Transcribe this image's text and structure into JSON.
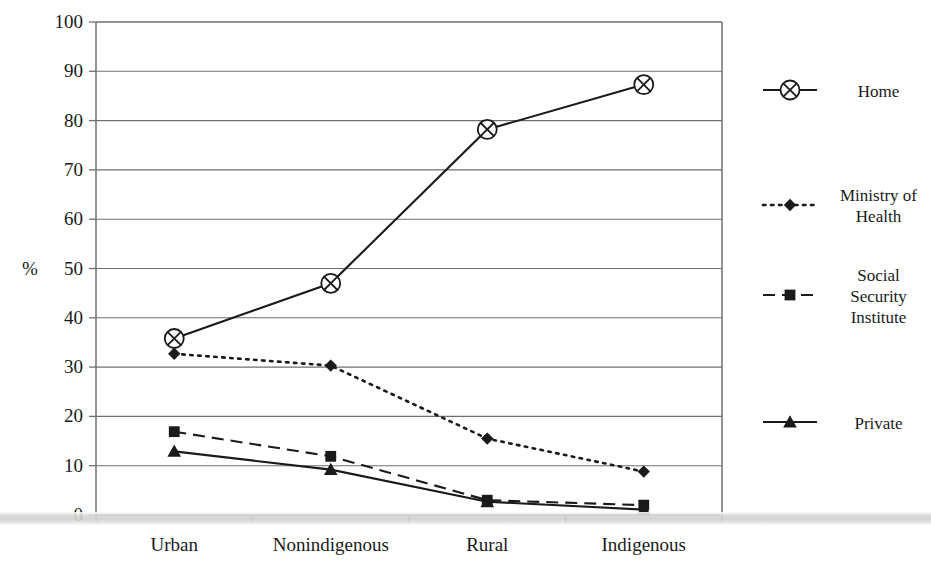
{
  "chart_data": {
    "type": "line",
    "title": "",
    "subtitle": "",
    "xlabel": "",
    "ylabel": "%",
    "categories": [
      "Urban",
      "Nonindigenous",
      "Rural",
      "Indigenous"
    ],
    "ylim": [
      0,
      100
    ],
    "ytick_labels": [
      "0",
      "10",
      "20",
      "30",
      "40",
      "50",
      "60",
      "70",
      "80",
      "90",
      "100"
    ],
    "ytick_values": [
      0,
      10,
      20,
      30,
      40,
      50,
      60,
      70,
      80,
      90,
      100
    ],
    "grid": true,
    "legend_position": "right",
    "series": [
      {
        "name": "Home",
        "marker": "circle-cross",
        "line_style": "solid",
        "color": "#1a1a1a",
        "values": [
          35.8,
          47.0,
          78.2,
          87.3
        ]
      },
      {
        "name": "Ministry of\nHealth",
        "marker": "diamond",
        "line_style": "dotted",
        "color": "#1a1a1a",
        "values": [
          32.7,
          30.3,
          15.5,
          8.8
        ]
      },
      {
        "name": "Social\nSecurity\nInstitute",
        "marker": "square",
        "line_style": "dashed",
        "color": "#1a1a1a",
        "values": [
          16.9,
          11.9,
          3.0,
          2.0
        ]
      },
      {
        "name": "Private",
        "marker": "triangle",
        "line_style": "solid",
        "color": "#1a1a1a",
        "values": [
          12.9,
          9.2,
          2.7,
          1.1
        ]
      }
    ]
  },
  "legend": {
    "items": [
      {
        "label": "Home"
      },
      {
        "label": "Ministry of\nHealth"
      },
      {
        "label": "Social\nSecurity\nInstitute"
      },
      {
        "label": "Private"
      }
    ]
  },
  "axes": {
    "y_unit_label": "%"
  }
}
